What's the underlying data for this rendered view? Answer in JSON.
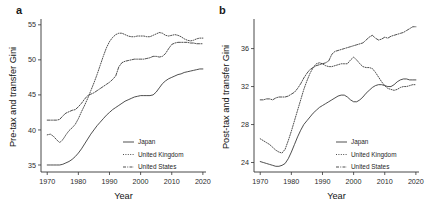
{
  "figure": {
    "panels": [
      {
        "label": "a",
        "name": "panel-a-pre-tax"
      },
      {
        "label": "b",
        "name": "panel-b-post-tax"
      }
    ]
  },
  "chart_data": [
    {
      "type": "line",
      "panel_label": "a",
      "title": "",
      "xlabel": "Year",
      "ylabel": "Pre-tax and transfer Gini",
      "xlim": [
        1968,
        2021
      ],
      "ylim": [
        34.0,
        55.4
      ],
      "xticks": [
        1970,
        1980,
        1990,
        2000,
        2010,
        2020
      ],
      "yticks": [
        35,
        40,
        45,
        50,
        55
      ],
      "grid": false,
      "legend_position": "bottom-right",
      "legend": [
        "Japan",
        "United Kingdom",
        "United States"
      ],
      "x": [
        1970,
        1971,
        1972,
        1973,
        1974,
        1975,
        1976,
        1977,
        1978,
        1979,
        1980,
        1981,
        1982,
        1983,
        1984,
        1985,
        1986,
        1987,
        1988,
        1989,
        1990,
        1991,
        1992,
        1993,
        1994,
        1995,
        1996,
        1997,
        1998,
        1999,
        2000,
        2001,
        2002,
        2003,
        2004,
        2005,
        2006,
        2007,
        2008,
        2009,
        2010,
        2011,
        2012,
        2013,
        2014,
        2015,
        2016,
        2017,
        2018,
        2019,
        2020
      ],
      "series": [
        {
          "name": "Japan",
          "style": "solid",
          "values": [
            35.0,
            35.0,
            35.0,
            35.0,
            35.0,
            35.1,
            35.3,
            35.5,
            35.8,
            36.2,
            36.7,
            37.3,
            38.0,
            38.7,
            39.4,
            40.0,
            40.6,
            41.1,
            41.6,
            42.1,
            42.5,
            42.9,
            43.2,
            43.5,
            43.8,
            44.1,
            44.3,
            44.5,
            44.7,
            44.8,
            44.9,
            44.9,
            44.9,
            44.9,
            45.0,
            45.4,
            46.0,
            46.6,
            47.0,
            47.3,
            47.5,
            47.7,
            47.9,
            48.0,
            48.2,
            48.3,
            48.4,
            48.5,
            48.6,
            48.7,
            48.7
          ]
        },
        {
          "name": "United Kingdom",
          "style": "dotted",
          "values": [
            39.3,
            39.4,
            39.1,
            38.6,
            38.2,
            38.6,
            39.3,
            39.9,
            40.3,
            40.8,
            41.6,
            42.6,
            43.5,
            44.5,
            45.6,
            46.7,
            47.9,
            49.2,
            50.5,
            51.7,
            52.6,
            53.2,
            53.6,
            53.8,
            53.8,
            53.6,
            53.4,
            53.3,
            53.3,
            53.4,
            53.4,
            53.4,
            53.3,
            53.3,
            53.5,
            53.7,
            53.9,
            53.8,
            53.5,
            53.4,
            53.5,
            53.6,
            53.5,
            53.3,
            53.0,
            52.8,
            52.7,
            52.8,
            53.0,
            53.1,
            53.1
          ]
        },
        {
          "name": "United States",
          "style": "dashdot",
          "values": [
            41.4,
            41.4,
            41.4,
            41.4,
            41.5,
            42.0,
            42.4,
            42.6,
            42.8,
            42.9,
            43.3,
            43.8,
            44.4,
            44.9,
            45.1,
            45.3,
            45.6,
            45.9,
            46.2,
            46.5,
            46.8,
            47.2,
            47.7,
            49.0,
            49.6,
            49.8,
            49.9,
            50.0,
            50.1,
            50.1,
            50.1,
            50.1,
            50.2,
            50.3,
            50.5,
            50.5,
            50.4,
            50.5,
            50.9,
            51.6,
            52.2,
            52.4,
            52.5,
            52.5,
            52.5,
            52.5,
            52.4,
            52.4,
            52.3,
            52.3,
            52.3
          ]
        }
      ]
    },
    {
      "type": "line",
      "panel_label": "b",
      "title": "",
      "xlabel": "Year",
      "ylabel": "Post-tax and transfer Gini",
      "xlim": [
        1968,
        2021
      ],
      "ylim": [
        23.0,
        38.8
      ],
      "xticks": [
        1970,
        1980,
        1990,
        2000,
        2010,
        2020
      ],
      "yticks": [
        24,
        28,
        32,
        36
      ],
      "grid": false,
      "legend_position": "bottom-right",
      "legend": [
        "Japan",
        "United Kingdom",
        "United States"
      ],
      "x": [
        1970,
        1971,
        1972,
        1973,
        1974,
        1975,
        1976,
        1977,
        1978,
        1979,
        1980,
        1981,
        1982,
        1983,
        1984,
        1985,
        1986,
        1987,
        1988,
        1989,
        1990,
        1991,
        1992,
        1993,
        1994,
        1995,
        1996,
        1997,
        1998,
        1999,
        2000,
        2001,
        2002,
        2003,
        2004,
        2005,
        2006,
        2007,
        2008,
        2009,
        2010,
        2011,
        2012,
        2013,
        2014,
        2015,
        2016,
        2017,
        2018,
        2019,
        2020
      ],
      "series": [
        {
          "name": "Japan",
          "style": "solid",
          "values": [
            24.1,
            24.0,
            23.9,
            23.8,
            23.7,
            23.6,
            23.6,
            23.7,
            23.9,
            24.4,
            25.1,
            25.9,
            26.7,
            27.4,
            28.0,
            28.4,
            28.8,
            29.2,
            29.5,
            29.8,
            30.0,
            30.2,
            30.4,
            30.6,
            30.8,
            31.0,
            31.1,
            31.1,
            30.9,
            30.6,
            30.4,
            30.4,
            30.6,
            30.9,
            31.3,
            31.6,
            31.9,
            32.1,
            32.2,
            32.2,
            32.1,
            32.0,
            32.0,
            32.2,
            32.5,
            32.7,
            32.8,
            32.8,
            32.7,
            32.7,
            32.7
          ]
        },
        {
          "name": "United Kingdom",
          "style": "dotted",
          "values": [
            26.5,
            26.3,
            26.1,
            25.9,
            25.6,
            25.3,
            25.1,
            25.0,
            25.4,
            26.3,
            27.3,
            28.4,
            29.5,
            30.6,
            31.7,
            32.6,
            33.4,
            34.0,
            34.4,
            34.5,
            34.4,
            34.2,
            34.1,
            34.1,
            34.2,
            34.3,
            34.4,
            34.4,
            34.4,
            34.8,
            35.1,
            34.8,
            34.4,
            34.1,
            34.0,
            34.0,
            33.9,
            33.5,
            33.0,
            32.5,
            32.1,
            31.8,
            31.7,
            31.6,
            31.7,
            31.9,
            32.0,
            32.0,
            32.1,
            32.2,
            32.2
          ]
        },
        {
          "name": "United States",
          "style": "dashdot",
          "values": [
            30.6,
            30.6,
            30.7,
            30.7,
            30.6,
            30.8,
            30.9,
            30.9,
            30.9,
            31.0,
            31.2,
            31.4,
            31.8,
            32.3,
            32.9,
            33.4,
            33.8,
            34.0,
            34.2,
            34.3,
            34.4,
            34.5,
            34.7,
            35.4,
            35.7,
            35.8,
            35.9,
            36.0,
            36.1,
            36.2,
            36.3,
            36.4,
            36.5,
            36.6,
            36.9,
            37.2,
            37.4,
            37.1,
            36.9,
            37.0,
            37.2,
            37.1,
            37.3,
            37.4,
            37.5,
            37.6,
            37.7,
            37.9,
            38.1,
            38.3,
            38.3
          ]
        }
      ]
    }
  ],
  "legend_items": [
    {
      "label": "Japan",
      "style": "solid"
    },
    {
      "label": "United Kingdom",
      "style": "dotted"
    },
    {
      "label": "United States",
      "style": "dashdot"
    }
  ]
}
